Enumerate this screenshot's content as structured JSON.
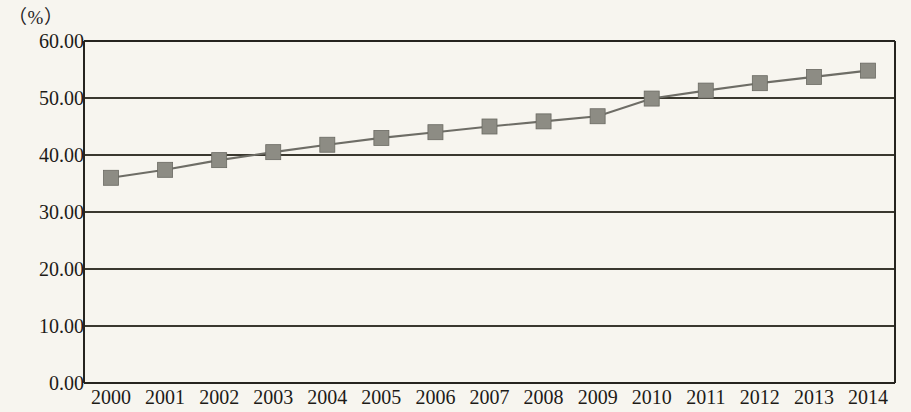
{
  "chart_data": {
    "type": "line",
    "title": "",
    "subtitle": "",
    "xlabel": "",
    "ylabel": "",
    "unit_label": "（%）",
    "categories": [
      "2000",
      "2001",
      "2002",
      "2003",
      "2004",
      "2005",
      "2006",
      "2007",
      "2008",
      "2009",
      "2010",
      "2011",
      "2012",
      "2013",
      "2014"
    ],
    "values": [
      36.0,
      37.4,
      39.1,
      40.5,
      41.8,
      43.0,
      44.0,
      45.0,
      45.9,
      46.8,
      49.9,
      51.3,
      52.6,
      53.7,
      54.8
    ],
    "series": [
      {
        "name": "",
        "values": [
          36.0,
          37.4,
          39.1,
          40.5,
          41.8,
          43.0,
          44.0,
          45.0,
          45.9,
          46.8,
          49.9,
          51.3,
          52.6,
          53.7,
          54.8
        ]
      }
    ],
    "ylim": [
      0,
      60
    ],
    "ytick_labels": [
      "0.00",
      "10.00",
      "20.00",
      "30.00",
      "40.00",
      "50.00",
      "60.00"
    ],
    "ytick_values": [
      0,
      10,
      20,
      30,
      40,
      50,
      60
    ],
    "xtick_labels": [
      "2000",
      "2001",
      "2002",
      "2003",
      "2004",
      "2005",
      "2006",
      "2007",
      "2008",
      "2009",
      "2010",
      "2011",
      "2012",
      "2013",
      "2014"
    ],
    "grid": true,
    "grid_axis": "y",
    "legend": false,
    "legend_position": "none",
    "marker": "square",
    "series_color": "#8d8c84",
    "line_color": "#6e6d66",
    "grid_color": "#3a382f",
    "axis_color": "#26241f",
    "background_color": "#f7f5ef"
  }
}
